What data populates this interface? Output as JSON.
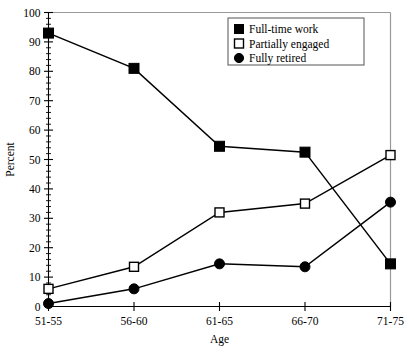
{
  "chart_data": {
    "type": "line",
    "title": "",
    "xlabel": "Age",
    "ylabel": "Percent",
    "categories": [
      "51-55",
      "56-60",
      "61-65",
      "66-70",
      "71-75"
    ],
    "ylim": [
      0,
      100
    ],
    "ytick_step": 10,
    "yminor_step": 2,
    "ytick_labels": [
      "0",
      "10",
      "20",
      "30",
      "40",
      "50",
      "60",
      "70",
      "80",
      "90",
      "100"
    ],
    "grid": false,
    "legend_position": "top-right",
    "series": [
      {
        "name": "Full-time work",
        "marker": "filled-square",
        "values": [
          93,
          81,
          54.5,
          52.5,
          14.5
        ]
      },
      {
        "name": "Partially engaged",
        "marker": "open-square",
        "values": [
          6,
          13.5,
          32,
          35,
          51.5
        ]
      },
      {
        "name": "Fully retired",
        "marker": "filled-circle",
        "values": [
          1,
          6,
          14.5,
          13.5,
          35.5
        ]
      }
    ]
  },
  "legend": {
    "entries": [
      {
        "label": "Full-time work",
        "marker": "filled-square-icon"
      },
      {
        "label": "Partially engaged",
        "marker": "open-square-icon"
      },
      {
        "label": "Fully retired",
        "marker": "filled-circle-icon"
      }
    ]
  },
  "axes": {
    "x_title": "Age",
    "y_title": "Percent"
  }
}
